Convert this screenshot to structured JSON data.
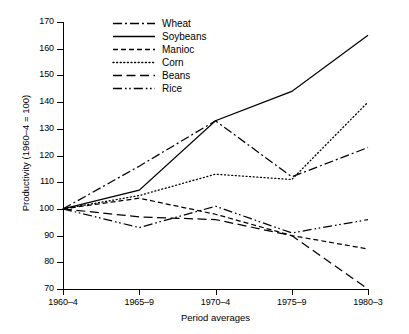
{
  "chart_data": {
    "type": "line",
    "title": "",
    "xlabel": "Period averages",
    "ylabel": "Productivity (1960–4 = 100)",
    "categories": [
      "1960–4",
      "1965–9",
      "1970–4",
      "1975–9",
      "1980–3"
    ],
    "yticks": [
      70,
      80,
      90,
      100,
      110,
      120,
      130,
      140,
      150,
      160,
      170
    ],
    "ylim": [
      70,
      170
    ],
    "grid": false,
    "legend_position": "top-center",
    "series": [
      {
        "name": "Wheat",
        "values": [
          100,
          116,
          133,
          112,
          123
        ],
        "dash": "dashdot"
      },
      {
        "name": "Soybeans",
        "values": [
          100,
          107,
          133,
          144,
          165
        ],
        "dash": "solid"
      },
      {
        "name": "Manioc",
        "values": [
          100,
          104,
          98,
          90,
          85
        ],
        "dash": "dashed"
      },
      {
        "name": "Corn",
        "values": [
          100,
          105,
          113,
          111,
          140
        ],
        "dash": "dotted"
      },
      {
        "name": "Beans",
        "values": [
          100,
          97,
          96,
          90,
          70
        ],
        "dash": "longdash"
      },
      {
        "name": "Rice",
        "values": [
          100,
          93,
          101,
          91,
          96
        ],
        "dash": "dashdotdot"
      }
    ]
  }
}
